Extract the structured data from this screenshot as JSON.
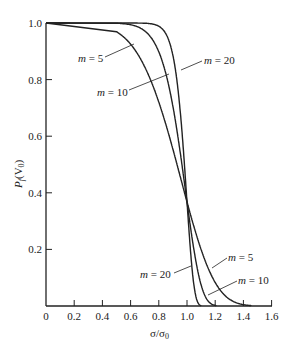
{
  "chart_data": {
    "type": "line",
    "title": "",
    "xlabel": "σ/σ0",
    "ylabel": "Pf(V0)",
    "xlim": [
      0,
      1.6
    ],
    "ylim": [
      0,
      1.0
    ],
    "x_ticks": [
      "0",
      "0.2",
      "0.4",
      "0.6",
      "0.8",
      "1.0",
      "1.2",
      "1.4",
      "1.6"
    ],
    "y_ticks": [
      "0.2",
      "0.4",
      "0.6",
      "0.8",
      "1.0"
    ],
    "grid": false,
    "legend": "inline annotations",
    "x": [
      0,
      0.2,
      0.4,
      0.5,
      0.6,
      0.7,
      0.8,
      0.9,
      0.95,
      1.0,
      1.05,
      1.1,
      1.15,
      1.2,
      1.3,
      1.4
    ],
    "series": [
      {
        "name": "m = 5",
        "values": [
          1.0,
          1.0,
          0.99,
          0.97,
          0.92,
          0.85,
          0.72,
          0.55,
          0.46,
          0.37,
          0.28,
          0.2,
          0.13,
          0.08,
          0.02,
          0.0
        ]
      },
      {
        "name": "m = 10",
        "values": [
          1.0,
          1.0,
          1.0,
          1.0,
          0.99,
          0.97,
          0.9,
          0.71,
          0.55,
          0.37,
          0.2,
          0.07,
          0.02,
          0.0,
          0.0,
          0.0
        ]
      },
      {
        "name": "m = 20",
        "values": [
          1.0,
          1.0,
          1.0,
          1.0,
          1.0,
          1.0,
          0.99,
          0.89,
          0.7,
          0.37,
          0.07,
          0.0,
          0.0,
          0.0,
          0.0,
          0.0
        ]
      }
    ],
    "annotations": [
      "m = 5",
      "m = 10",
      "m = 20",
      "m = 5",
      "m = 10",
      "m = 20"
    ]
  },
  "labels": {
    "xlabel": "σ/σ",
    "xlabel_sub": "0",
    "ylabel_main": "P",
    "ylabel_sub1": "f",
    "ylabel_mid": "(V",
    "ylabel_sub2": "0",
    "ylabel_end": ")",
    "top_m5": "m = 5",
    "top_m10": "m = 10",
    "top_m20": "m = 20",
    "bot_m5": "m = 5",
    "bot_m10": "m = 10",
    "bot_m20": "m = 20"
  }
}
